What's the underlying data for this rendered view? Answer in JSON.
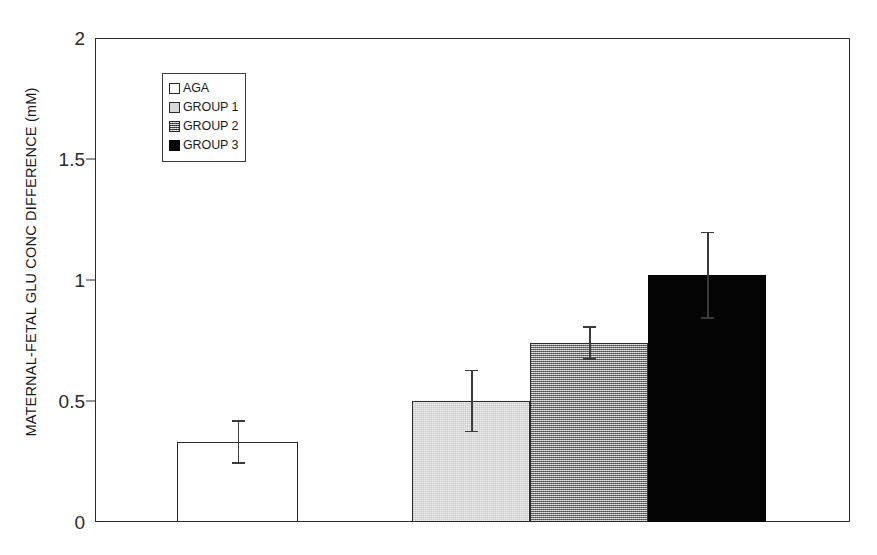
{
  "chart_data": {
    "type": "bar",
    "title": "",
    "subtitle": "",
    "xlabel": "",
    "ylabel": "MATERNAL-FETAL GLU CONC DIFFERENCE (mM)",
    "ylim": [
      0,
      2
    ],
    "yticks": [
      0,
      0.5,
      1,
      1.5,
      2
    ],
    "ytick_labels": [
      "0",
      "0.5",
      "1",
      "1.5",
      "2"
    ],
    "xticks": [],
    "xtick_labels": [],
    "grid": false,
    "legend_position": "upper left",
    "categories": [
      "AGA",
      "GROUP 1",
      "GROUP 2",
      "GROUP 3"
    ],
    "values": [
      0.33,
      0.5,
      0.74,
      1.02
    ],
    "errors": [
      0.09,
      0.13,
      0.07,
      0.18
    ],
    "error_type": "SEM",
    "series": [
      {
        "name": "AGA",
        "value": 0.33,
        "error": 0.09,
        "fill": "white",
        "fill_color": "#ffffff",
        "edge_color": "#2b2b2b"
      },
      {
        "name": "GROUP 1",
        "value": 0.5,
        "error": 0.13,
        "fill": "light",
        "fill_color": "#efefef",
        "edge_color": "#2b2b2b"
      },
      {
        "name": "GROUP 2",
        "value": 0.74,
        "error": 0.07,
        "fill": "medium",
        "fill_color": "#a2a2a2",
        "edge_color": "#2b2b2b"
      },
      {
        "name": "GROUP 3",
        "value": 1.02,
        "error": 0.18,
        "fill": "black",
        "fill_color": "#050505",
        "edge_color": "#050505"
      }
    ]
  },
  "legend": {
    "items": [
      {
        "label": "AGA",
        "swatch": "legend-swatch-aga"
      },
      {
        "label": "GROUP 1",
        "swatch": "legend-swatch-group-1"
      },
      {
        "label": "GROUP 2",
        "swatch": "legend-swatch-group-2"
      },
      {
        "label": "GROUP 3",
        "swatch": "legend-swatch-group-3"
      }
    ]
  },
  "axis": {
    "y_label": "MATERNAL-FETAL GLU CONC DIFFERENCE (mM)",
    "y_tick_labels": [
      "2",
      "1.5",
      "1",
      "0.5",
      "0"
    ]
  },
  "colors": {
    "axis": "#2b2b2b",
    "text": "#1a1a1a",
    "error_bar": "#3a3a3a",
    "bar_white": "#ffffff",
    "bar_light": "#efefef",
    "bar_medium": "#a2a2a2",
    "bar_black": "#050505"
  }
}
